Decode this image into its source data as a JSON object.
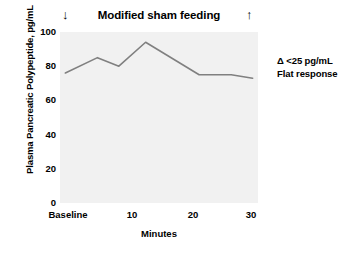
{
  "chart_data": {
    "type": "line",
    "title": "Modified sham feeding",
    "xlabel": "Minutes",
    "ylabel": "Plasma Pancreatic Polypeptide, pg/mL",
    "ylim": [
      0,
      100
    ],
    "xlim": [
      -3,
      34
    ],
    "grid": false,
    "legend": "none",
    "x": [
      -2,
      4,
      8,
      13,
      23,
      29,
      33
    ],
    "values": [
      76,
      85,
      80,
      94,
      75,
      75,
      73
    ],
    "series": [
      {
        "name": "Plasma pancreatic polypeptide",
        "values": [
          76,
          85,
          80,
          94,
          75,
          75,
          73
        ],
        "color": "#808080"
      }
    ],
    "y_ticks": [
      0,
      20,
      40,
      60,
      80,
      100
    ],
    "y_tick_labels": [
      "0",
      "20",
      "40",
      "60",
      "80",
      "100"
    ],
    "x_ticks": [
      -2,
      10,
      20,
      30
    ],
    "x_tick_labels": [
      "Baseline",
      "10",
      "20",
      "30"
    ],
    "annotations": [
      {
        "name": "start-marker",
        "text": "↓",
        "x": -2.5,
        "y": 106
      },
      {
        "name": "end-marker",
        "text": "↑",
        "x": 32,
        "y": 106
      },
      {
        "name": "delta-note-line1",
        "text": "Δ <25 pg/mL"
      },
      {
        "name": "delta-note-line2",
        "text": "Flat response"
      }
    ],
    "plot_background": "#f1f1f1",
    "figure_background": "#ffffff"
  },
  "chart": {
    "title": "Modified sham feeding",
    "start_marker": "↓",
    "end_marker": "↑",
    "y_axis_title": "Plasma Pancreatic Polypeptide, pg/mL",
    "x_axis_title": "Minutes",
    "y_tick_labels": [
      "100",
      "80",
      "60",
      "40",
      "20",
      "0"
    ],
    "x_tick_labels": [
      "Baseline",
      "10",
      "20",
      "30"
    ],
    "annotation": {
      "line1": "Δ <25 pg/mL",
      "line2": "Flat response"
    }
  }
}
